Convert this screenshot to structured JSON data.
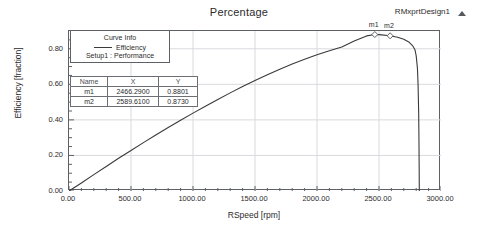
{
  "chart_data": {
    "type": "line",
    "title": "Percentage",
    "xlabel": "RSpeed [rpm]",
    "ylabel": "Efficiency [fraction]",
    "xlim": [
      0,
      3000
    ],
    "ylim": [
      0,
      0.9
    ],
    "grid": true,
    "legend_position": "top-left-inside",
    "series": [
      {
        "name": "Efficiency",
        "setup": "Setup1 : Performance",
        "color": "#3a3a3a",
        "x": [
          0,
          50,
          100,
          200,
          300,
          400,
          500,
          600,
          700,
          800,
          900,
          1000,
          1100,
          1200,
          1300,
          1400,
          1500,
          1600,
          1700,
          1800,
          1900,
          2000,
          2100,
          2200,
          2300,
          2400,
          2466.29,
          2500,
          2589.61,
          2650,
          2700,
          2740,
          2770,
          2790,
          2800,
          2810,
          2815,
          2820,
          2822,
          2824,
          2825
        ],
        "y": [
          0.0,
          0.022,
          0.045,
          0.092,
          0.138,
          0.184,
          0.228,
          0.272,
          0.315,
          0.357,
          0.398,
          0.438,
          0.477,
          0.515,
          0.552,
          0.588,
          0.622,
          0.654,
          0.685,
          0.714,
          0.741,
          0.766,
          0.789,
          0.81,
          0.8435,
          0.8725,
          0.8801,
          0.8795,
          0.873,
          0.8645,
          0.8535,
          0.8385,
          0.818,
          0.795,
          0.76,
          0.69,
          0.6,
          0.44,
          0.3,
          0.13,
          0.0
        ]
      }
    ],
    "xticks": [
      "0.00",
      "500.00",
      "1000.00",
      "1500.00",
      "2000.00",
      "2500.00",
      "3000.00"
    ],
    "xtick_values": [
      0,
      500,
      1000,
      1500,
      2000,
      2500,
      3000
    ],
    "yticks": [
      "0.00",
      "0.20",
      "0.40",
      "0.60",
      "0.80"
    ],
    "ytick_values": [
      0.0,
      0.2,
      0.4,
      0.6,
      0.8
    ],
    "markers": [
      {
        "name": "m1",
        "x": 2466.29,
        "y": 0.8801,
        "x_text": "2466.2900",
        "y_text": "0.8801"
      },
      {
        "name": "m2",
        "x": 2589.61,
        "y": 0.873,
        "x_text": "2589.6100",
        "y_text": "0.8730"
      }
    ],
    "colors": {
      "curve": "#3a3a3a",
      "frame": "#5d6166",
      "grid": "#d8dade",
      "text": "#2b2b2b",
      "background": "#ffffff"
    }
  },
  "title": "Percentage",
  "design": {
    "label": "RMxprtDesign1"
  },
  "legend": {
    "header": "Curve Info",
    "series_label": "Efficiency",
    "setup_label": "Setup1 : Performance"
  },
  "marker_table": {
    "headers": [
      "Name",
      "X",
      "Y"
    ],
    "rows": [
      [
        "m1",
        "2466.2900",
        "0.8801"
      ],
      [
        "m2",
        "2589.6100",
        "0.8730"
      ]
    ]
  },
  "marker_tags": [
    {
      "label": "m1"
    },
    {
      "label": "m2"
    }
  ],
  "axes": {
    "x_title": "RSpeed [rpm]",
    "y_title": "Efficiency [fraction]"
  }
}
